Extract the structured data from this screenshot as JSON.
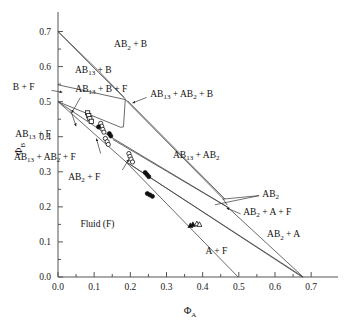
{
  "chart_data": {
    "type": "scatter",
    "title": "",
    "subtitle": "",
    "xlabel": "ΦA",
    "ylabel": "ΦB",
    "xlabel_base": "Φ",
    "xlabel_sub": "A",
    "ylabel_base": "Φ",
    "ylabel_sub": "B",
    "xlim": [
      0.0,
      0.73
    ],
    "ylim": [
      0.0,
      0.73
    ],
    "xticks": [
      0.0,
      0.1,
      0.2,
      0.3,
      0.4,
      0.5,
      0.6,
      0.7
    ],
    "yticks": [
      0.0,
      0.1,
      0.2,
      0.3,
      0.4,
      0.5,
      0.6,
      0.7
    ],
    "xtick_labels": [
      "0.0",
      "0.1",
      "0.2",
      "0.3",
      "0.4",
      "0.5",
      "0.6",
      "0.7"
    ],
    "ytick_labels": [
      "0.0",
      "0.1",
      "0.2",
      "0.3",
      "0.4",
      "0.5",
      "0.6",
      "0.7"
    ],
    "minor_ticks": true,
    "grid": false,
    "legend": "none",
    "region_labels": [
      {
        "id": "ab2-b",
        "text_parts": [
          {
            "t": "AB",
            "sub": false
          },
          {
            "t": "2",
            "sub": true
          },
          {
            "t": " + B",
            "sub": false
          }
        ],
        "x": 0.155,
        "y": 0.655,
        "anchor": "start"
      },
      {
        "id": "ab13-b",
        "text_parts": [
          {
            "t": "AB",
            "sub": false
          },
          {
            "t": "13",
            "sub": true
          },
          {
            "t": " + B",
            "sub": false
          }
        ],
        "x": 0.047,
        "y": 0.582,
        "anchor": "start"
      },
      {
        "id": "b-f",
        "text_parts": [
          {
            "t": "B + F",
            "sub": false
          }
        ],
        "x": -0.125,
        "y": 0.533,
        "anchor": "start"
      },
      {
        "id": "ab13-b-f",
        "text_parts": [
          {
            "t": "AB",
            "sub": false
          },
          {
            "t": "13",
            "sub": true
          },
          {
            "t": " + B + F",
            "sub": false
          }
        ],
        "x": 0.048,
        "y": 0.527,
        "anchor": "start"
      },
      {
        "id": "ab13-ab2-b",
        "text_parts": [
          {
            "t": "AB",
            "sub": false
          },
          {
            "t": "13",
            "sub": true
          },
          {
            "t": " + AB",
            "sub": false
          },
          {
            "t": "2",
            "sub": true
          },
          {
            "t": " + B",
            "sub": false
          }
        ],
        "x": 0.255,
        "y": 0.513,
        "anchor": "start"
      },
      {
        "id": "ab13-f",
        "text_parts": [
          {
            "t": "AB",
            "sub": false
          },
          {
            "t": "13",
            "sub": true
          },
          {
            "t": " + F",
            "sub": false
          }
        ],
        "x": -0.118,
        "y": 0.399,
        "anchor": "start"
      },
      {
        "id": "ab13-ab2",
        "text_parts": [
          {
            "t": "AB",
            "sub": false
          },
          {
            "t": "13",
            "sub": true
          },
          {
            "t": " + AB",
            "sub": false
          },
          {
            "t": "2",
            "sub": true
          }
        ],
        "x": 0.318,
        "y": 0.339,
        "anchor": "start"
      },
      {
        "id": "ab13-ab2-f",
        "text_parts": [
          {
            "t": "AB",
            "sub": false
          },
          {
            "t": "13",
            "sub": true
          },
          {
            "t": " + AB",
            "sub": false
          },
          {
            "t": "2",
            "sub": true
          },
          {
            "t": " + F",
            "sub": false
          }
        ],
        "x": -0.122,
        "y": 0.333,
        "anchor": "start"
      },
      {
        "id": "ab2-f",
        "text_parts": [
          {
            "t": "AB",
            "sub": false
          },
          {
            "t": "2",
            "sub": true
          },
          {
            "t": " + F",
            "sub": false
          }
        ],
        "x": 0.028,
        "y": 0.278,
        "anchor": "start"
      },
      {
        "id": "ab2",
        "text_parts": [
          {
            "t": "AB",
            "sub": false
          },
          {
            "t": "2",
            "sub": true
          }
        ],
        "x": 0.565,
        "y": 0.229,
        "anchor": "start"
      },
      {
        "id": "ab2-a-f",
        "text_parts": [
          {
            "t": "AB",
            "sub": false
          },
          {
            "t": "2",
            "sub": true
          },
          {
            "t": " + A + F",
            "sub": false
          }
        ],
        "x": 0.512,
        "y": 0.177,
        "anchor": "start"
      },
      {
        "id": "ab2-a",
        "text_parts": [
          {
            "t": "AB",
            "sub": false
          },
          {
            "t": "2",
            "sub": true
          },
          {
            "t": " + A",
            "sub": false
          }
        ],
        "x": 0.578,
        "y": 0.113,
        "anchor": "start"
      },
      {
        "id": "fluid-f",
        "text_parts": [
          {
            "t": "Fluid (F)",
            "sub": false
          }
        ],
        "x": 0.062,
        "y": 0.142,
        "anchor": "start"
      },
      {
        "id": "a-f",
        "text_parts": [
          {
            "t": "A + F",
            "sub": false
          }
        ],
        "x": 0.408,
        "y": 0.065,
        "anchor": "start"
      }
    ],
    "phase_lines": [
      {
        "id": "b-axis-to-ab13b-upper",
        "points": [
          [
            0.0,
            0.7
          ],
          [
            0.108,
            0.592
          ]
        ]
      },
      {
        "id": "b-axis-to-ab13b-lower",
        "points": [
          [
            0.0,
            0.7
          ],
          [
            0.112,
            0.583
          ]
        ]
      },
      {
        "id": "ab13b-band-upper",
        "points": [
          [
            0.108,
            0.592
          ],
          [
            0.183,
            0.512
          ]
        ]
      },
      {
        "id": "ab13b-band-lower",
        "points": [
          [
            0.112,
            0.583
          ],
          [
            0.188,
            0.506
          ]
        ]
      },
      {
        "id": "bf-boundary",
        "points": [
          [
            0.0,
            0.548
          ],
          [
            0.186,
            0.506
          ]
        ]
      },
      {
        "id": "ab13-solidus-upper",
        "points": [
          [
            0.0,
            0.5
          ],
          [
            0.173,
            0.427
          ]
        ]
      },
      {
        "id": "ab13-tieline-vert",
        "points": [
          [
            0.186,
            0.506
          ],
          [
            0.181,
            0.428
          ]
        ]
      },
      {
        "id": "ab13-region-base",
        "points": [
          [
            0.173,
            0.427
          ],
          [
            0.181,
            0.428
          ]
        ]
      },
      {
        "id": "ab13-fluid-lower",
        "points": [
          [
            0.0,
            0.5
          ],
          [
            0.148,
            0.398
          ]
        ]
      },
      {
        "id": "ab13ab2-band-upper",
        "points": [
          [
            0.186,
            0.506
          ],
          [
            0.455,
            0.225
          ]
        ]
      },
      {
        "id": "ab13ab2-band-lower",
        "points": [
          [
            0.192,
            0.503
          ],
          [
            0.462,
            0.222
          ]
        ]
      },
      {
        "id": "ab13ab2-tail-upper",
        "points": [
          [
            0.455,
            0.225
          ],
          [
            0.468,
            0.205
          ]
        ]
      },
      {
        "id": "ab2-fluid-upper",
        "points": [
          [
            0.148,
            0.398
          ],
          [
            0.468,
            0.2
          ]
        ]
      },
      {
        "id": "ab2-fluid-mid",
        "points": [
          [
            0.152,
            0.392
          ],
          [
            0.474,
            0.196
          ]
        ]
      },
      {
        "id": "fluid-binodal-main",
        "points": [
          [
            0.0,
            0.5
          ],
          [
            0.186,
            0.33
          ]
        ]
      },
      {
        "id": "ab2-a-f-upper",
        "points": [
          [
            0.186,
            0.33
          ],
          [
            0.675,
            0.0
          ]
        ]
      },
      {
        "id": "ab2-a-f-lower",
        "points": [
          [
            0.192,
            0.326
          ],
          [
            0.678,
            0.0
          ]
        ]
      },
      {
        "id": "a-f-boundary",
        "points": [
          [
            0.186,
            0.33
          ],
          [
            0.498,
            0.0
          ]
        ]
      },
      {
        "id": "ab2-corner-line",
        "points": [
          [
            0.468,
            0.2
          ],
          [
            0.678,
            0.0
          ]
        ]
      }
    ],
    "data_points": [
      {
        "series": "open-square",
        "marker": "square-open",
        "x": 0.082,
        "y": 0.468
      },
      {
        "series": "open-square",
        "marker": "square-open",
        "x": 0.085,
        "y": 0.46
      },
      {
        "series": "open-square",
        "marker": "square-open",
        "x": 0.088,
        "y": 0.452
      },
      {
        "series": "open-square",
        "marker": "square-open",
        "x": 0.092,
        "y": 0.444
      },
      {
        "series": "open-circle",
        "marker": "circle-open",
        "x": 0.118,
        "y": 0.438
      },
      {
        "series": "open-circle",
        "marker": "circle-open",
        "x": 0.121,
        "y": 0.43
      },
      {
        "series": "filled-circle",
        "marker": "circle-filled",
        "x": 0.112,
        "y": 0.428
      },
      {
        "series": "open-circle",
        "marker": "circle-open",
        "x": 0.124,
        "y": 0.421
      },
      {
        "series": "open-circle",
        "marker": "circle-open",
        "x": 0.127,
        "y": 0.413
      },
      {
        "series": "filled-circle",
        "marker": "circle-filled",
        "x": 0.142,
        "y": 0.409
      },
      {
        "series": "filled-circle",
        "marker": "circle-filled",
        "x": 0.146,
        "y": 0.402
      },
      {
        "series": "open-circle",
        "marker": "circle-open",
        "x": 0.131,
        "y": 0.395
      },
      {
        "series": "open-circle",
        "marker": "circle-open",
        "x": 0.136,
        "y": 0.386
      },
      {
        "series": "open-circle",
        "marker": "circle-open",
        "x": 0.139,
        "y": 0.378
      },
      {
        "series": "open-circle",
        "marker": "circle-open",
        "x": 0.196,
        "y": 0.352
      },
      {
        "series": "open-circle",
        "marker": "circle-open",
        "x": 0.199,
        "y": 0.344
      },
      {
        "series": "open-circle",
        "marker": "circle-open",
        "x": 0.202,
        "y": 0.336
      },
      {
        "series": "open-circle",
        "marker": "circle-open",
        "x": 0.206,
        "y": 0.328
      },
      {
        "series": "filled-circle",
        "marker": "circle-filled",
        "x": 0.241,
        "y": 0.298
      },
      {
        "series": "filled-circle",
        "marker": "circle-filled",
        "x": 0.246,
        "y": 0.292
      },
      {
        "series": "filled-circle",
        "marker": "circle-filled",
        "x": 0.251,
        "y": 0.286
      },
      {
        "series": "filled-circle",
        "marker": "circle-filled",
        "x": 0.247,
        "y": 0.238
      },
      {
        "series": "filled-circle",
        "marker": "circle-filled",
        "x": 0.254,
        "y": 0.234
      },
      {
        "series": "filled-circle",
        "marker": "circle-filled",
        "x": 0.261,
        "y": 0.23
      },
      {
        "series": "filled-triangle",
        "marker": "triangle-filled",
        "x": 0.366,
        "y": 0.147
      },
      {
        "series": "filled-triangle",
        "marker": "triangle-filled",
        "x": 0.373,
        "y": 0.15
      },
      {
        "series": "open-triangle",
        "marker": "triangle-open",
        "x": 0.384,
        "y": 0.152
      },
      {
        "series": "open-triangle",
        "marker": "triangle-open",
        "x": 0.391,
        "y": 0.15
      }
    ],
    "leader_lines": [
      {
        "id": "bf-leader",
        "points": [
          [
            -0.018,
            0.532
          ],
          [
            0.012,
            0.527
          ]
        ],
        "arrow": true
      },
      {
        "id": "ab13bf-leader",
        "points": [
          [
            0.062,
            0.512
          ],
          [
            0.038,
            0.468
          ]
        ],
        "arrow": true
      },
      {
        "id": "ab13ab2b-leader",
        "points": [
          [
            0.245,
            0.512
          ],
          [
            0.206,
            0.496
          ]
        ],
        "arrow": true
      },
      {
        "id": "ab13f-leader",
        "points": [
          [
            0.035,
            0.475
          ],
          [
            0.05,
            0.43
          ]
        ],
        "arrow": true
      },
      {
        "id": "ab13ab2f-leader",
        "points": [
          [
            0.118,
            0.352
          ],
          [
            0.106,
            0.395
          ]
        ],
        "arrow": true
      },
      {
        "id": "ab2f-leader",
        "points": [
          [
            0.178,
            0.305
          ],
          [
            0.196,
            0.336
          ]
        ],
        "arrow": true
      },
      {
        "id": "ab2-leader-a",
        "points": [
          [
            0.556,
            0.232
          ],
          [
            0.455,
            0.222
          ]
        ],
        "arrow": false
      },
      {
        "id": "ab2-leader-b",
        "points": [
          [
            0.556,
            0.232
          ],
          [
            0.434,
            0.206
          ]
        ],
        "arrow": false
      },
      {
        "id": "ab2af-leader",
        "points": [
          [
            0.505,
            0.18
          ],
          [
            0.466,
            0.197
          ]
        ],
        "arrow": true
      }
    ]
  }
}
